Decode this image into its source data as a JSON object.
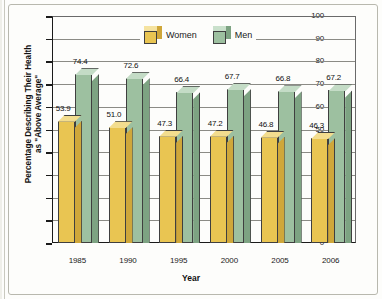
{
  "chart_data": {
    "type": "bar",
    "title": "",
    "xlabel": "Year",
    "ylabel": "Percentage Describing Their Health as \"Above Average\"",
    "ylabel_line1": "Percentage Describing Their Health",
    "ylabel_line2": "as \"Above Average\"",
    "categories": [
      "1985",
      "1990",
      "1995",
      "2000",
      "2005",
      "2006"
    ],
    "ylim": [
      0,
      100
    ],
    "yticks": [
      0,
      10,
      20,
      30,
      40,
      50,
      60,
      70,
      80,
      90,
      100
    ],
    "ytick_labels": [
      "0",
      "10",
      "20",
      "30",
      "40",
      "50",
      "60",
      "70",
      "80",
      "90",
      "100"
    ],
    "grid": true,
    "legend_position": "top-center-inline",
    "series": [
      {
        "name": "Women",
        "color": "#e9c552",
        "values": [
          53.9,
          51.0,
          47.3,
          47.2,
          46.8,
          46.3
        ],
        "labels": [
          "53.9",
          "51.0",
          "47.3",
          "47.2",
          "46.8",
          "46.3"
        ]
      },
      {
        "name": "Men",
        "color": "#9dc0a0",
        "values": [
          74.4,
          72.6,
          66.4,
          67.7,
          66.8,
          67.2
        ],
        "labels": [
          "74.4",
          "72.6",
          "66.4",
          "67.7",
          "66.8",
          "67.2"
        ]
      }
    ]
  },
  "legend": {
    "items": [
      {
        "label": "Women",
        "icon": "cube-icon-women"
      },
      {
        "label": "Men",
        "icon": "cube-icon-men"
      }
    ]
  },
  "colors": {
    "women_front": "#e9c552",
    "women_top": "#f3dd8e",
    "women_side": "#cfa73a",
    "men_front": "#9dc0a0",
    "men_top": "#c4dcc6",
    "men_side": "#7da382",
    "axis": "#1a1a1a",
    "grid": "#8b8b85",
    "background": "#fdfdfb"
  }
}
